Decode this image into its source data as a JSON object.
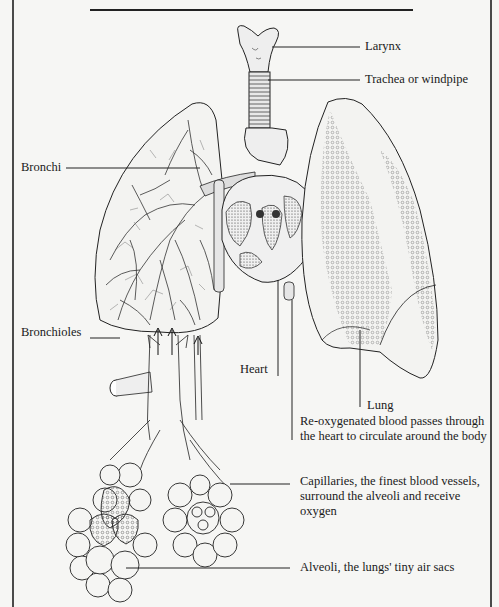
{
  "diagram": {
    "labels": {
      "larynx": "Larynx",
      "trachea": "Trachea or windpipe",
      "bronchi": "Bronchi",
      "bronchioles": "Bronchioles",
      "heart": "Heart",
      "lung": "Lung",
      "blood": "Re-oxygenated blood passes through the heart to circulate around the body",
      "capillaries": "Capillaries, the finest blood vessels, surround the alveoli and receive oxygen",
      "alveoli": "Alveoli, the lungs' tiny air sacs"
    },
    "colors": {
      "ink": "#1a1a1a",
      "paper": "#f6f6f4",
      "frame": "#4a4a4a"
    }
  }
}
